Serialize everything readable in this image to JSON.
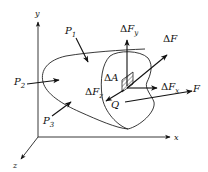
{
  "diagram": {
    "axes": {
      "x_label": "x",
      "y_label": "y",
      "z_label": "z"
    },
    "external_forces": {
      "p1": {
        "symbol": "P",
        "sub": "1"
      },
      "p2": {
        "symbol": "P",
        "sub": "2"
      },
      "p3": {
        "symbol": "P",
        "sub": "3"
      },
      "f": {
        "symbol": "F"
      }
    },
    "internal": {
      "area": {
        "delta": "Δ",
        "symbol": "A"
      },
      "point": "Q",
      "force": {
        "delta": "Δ",
        "symbol": "F"
      },
      "fx": {
        "delta": "Δ",
        "symbol": "F",
        "sub": "x"
      },
      "fy": {
        "delta": "Δ",
        "symbol": "F",
        "sub": "y"
      },
      "fz": {
        "delta": "Δ",
        "symbol": "F",
        "sub": "z"
      }
    },
    "colors": {
      "ink": "#111111",
      "background": "#ffffff"
    }
  }
}
